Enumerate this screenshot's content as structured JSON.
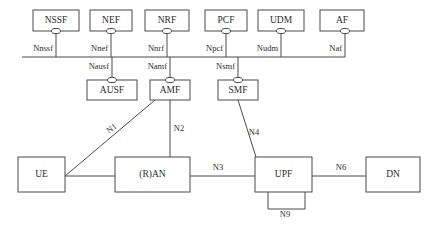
{
  "diagram": {
    "type": "5g-service-based-architecture",
    "background_color": "#ffffff",
    "stroke_color": "#4a4a4a",
    "text_color": "#2b2b2b",
    "service_bus": {
      "name": "service-based-interface-bus",
      "x1": 22,
      "x2": 345,
      "y": 57
    },
    "top_row_functions": [
      {
        "id": "nssf",
        "label": "NSSF",
        "interface": "Nnssf",
        "box_x": 33,
        "box_y": 10,
        "box_w": 46,
        "box_h": 21,
        "stem_x": 56
      },
      {
        "id": "nef",
        "label": "NEF",
        "interface": "Nnef",
        "box_x": 90,
        "box_y": 10,
        "box_w": 42,
        "box_h": 21,
        "stem_x": 111
      },
      {
        "id": "nrf",
        "label": "NRF",
        "interface": "Nnrf",
        "box_x": 145,
        "box_y": 10,
        "box_w": 44,
        "box_h": 21,
        "stem_x": 167
      },
      {
        "id": "pcf",
        "label": "PCF",
        "interface": "Npcf",
        "box_x": 205,
        "box_y": 10,
        "box_w": 42,
        "box_h": 21,
        "stem_x": 226
      },
      {
        "id": "udm",
        "label": "UDM",
        "interface": "Nudm",
        "box_x": 258,
        "box_y": 10,
        "box_w": 46,
        "box_h": 21,
        "stem_x": 281
      },
      {
        "id": "af",
        "label": "AF",
        "interface": "Naf",
        "box_x": 320,
        "box_y": 10,
        "box_w": 44,
        "box_h": 21,
        "stem_x": 345
      }
    ],
    "middle_row_functions": [
      {
        "id": "ausf",
        "label": "AUSF",
        "interface": "Nausf",
        "box_x": 87,
        "box_y": 80,
        "box_w": 50,
        "box_h": 20,
        "stem_x": 112
      },
      {
        "id": "amf",
        "label": "AMF",
        "interface": "Namf",
        "box_x": 150,
        "box_y": 80,
        "box_w": 40,
        "box_h": 20,
        "stem_x": 170
      },
      {
        "id": "smf",
        "label": "SMF",
        "interface": "Nsmf",
        "box_x": 218,
        "box_y": 80,
        "box_w": 40,
        "box_h": 20,
        "stem_x": 238
      }
    ],
    "bottom_row_functions": [
      {
        "id": "ue",
        "label": "UE",
        "box_x": 18,
        "box_y": 157,
        "box_w": 47,
        "box_h": 35
      },
      {
        "id": "ran",
        "label": "(R)AN",
        "box_x": 115,
        "box_y": 157,
        "box_w": 75,
        "box_h": 35
      },
      {
        "id": "upf",
        "label": "UPF",
        "box_x": 255,
        "box_y": 157,
        "box_w": 57,
        "box_h": 35
      },
      {
        "id": "dn",
        "label": "DN",
        "box_x": 366,
        "box_y": 157,
        "box_w": 54,
        "box_h": 35
      }
    ],
    "reference_points": [
      {
        "id": "n1",
        "label": "N1",
        "label_x": 112,
        "label_y": 129,
        "rotation": -37
      },
      {
        "id": "n2",
        "label": "N2",
        "label_x": 179,
        "label_y": 129,
        "rotation": 0
      },
      {
        "id": "n3",
        "label": "N3",
        "label_x": 218,
        "label_y": 168,
        "rotation": 0
      },
      {
        "id": "n4",
        "label": "N4",
        "label_x": 254,
        "label_y": 133,
        "rotation": 0
      },
      {
        "id": "n6",
        "label": "N6",
        "label_x": 341,
        "label_y": 168,
        "rotation": 0
      },
      {
        "id": "n9",
        "label": "N9",
        "label_x": 285,
        "label_y": 215,
        "rotation": 0
      }
    ]
  }
}
